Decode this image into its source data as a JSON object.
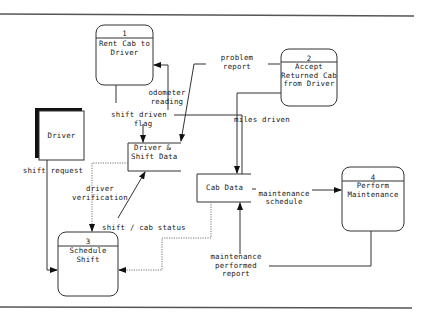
{
  "diagram": {
    "type": "data-flow-diagram",
    "processes": [
      {
        "id": "1",
        "label_lines": [
          "Rent Cab to",
          "Driver"
        ]
      },
      {
        "id": "2",
        "label_lines": [
          "Accept",
          "Returned Cab",
          "from Driver"
        ]
      },
      {
        "id": "3",
        "label_lines": [
          "Schedule",
          "Shift"
        ]
      },
      {
        "id": "4",
        "label_lines": [
          "Perform",
          "Maintenance"
        ]
      }
    ],
    "external_entities": [
      {
        "label": "Driver"
      }
    ],
    "data_stores": [
      {
        "label_lines": [
          "Driver &",
          "Shift Data"
        ]
      },
      {
        "label": "Cab Data"
      }
    ],
    "flows": [
      {
        "label_lines": [
          "odometer",
          "reading"
        ]
      },
      {
        "label_lines": [
          "shift driven",
          "flag"
        ]
      },
      {
        "label_lines": [
          "problem",
          "report"
        ]
      },
      {
        "label": "miles driven"
      },
      {
        "label": "shift request"
      },
      {
        "label_lines": [
          "driver",
          "verification"
        ]
      },
      {
        "label": "shift / cab status"
      },
      {
        "label_lines": [
          "maintenance",
          "schedule"
        ]
      },
      {
        "label_lines": [
          "maintenance",
          "performed",
          "report"
        ]
      }
    ]
  }
}
